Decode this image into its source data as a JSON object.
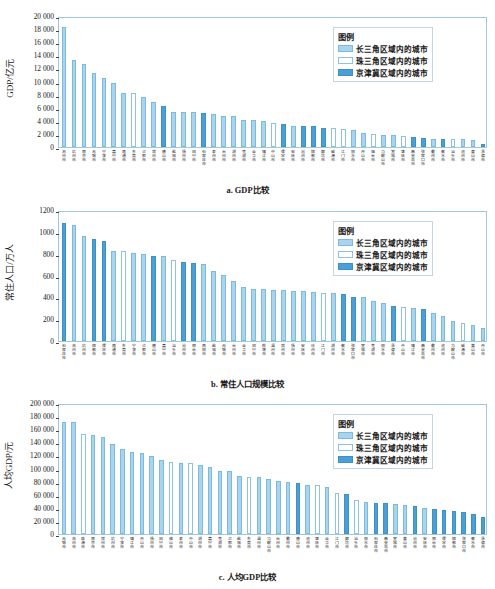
{
  "figure": {
    "legend_title": "图例",
    "legend_items": [
      {
        "key": "cj",
        "label": "长三角区域内的城市",
        "color": "#a9d4ec"
      },
      {
        "key": "zj",
        "label": "珠三角区域内的城市",
        "color": "#ffffff"
      },
      {
        "key": "jjj",
        "label": "京津冀区域内的城市",
        "color": "#48a0d6"
      }
    ]
  },
  "chart_data": [
    {
      "type": "bar",
      "id": "a",
      "title": "a. GDP比较",
      "xlabel": "",
      "ylabel": "GDP/亿元",
      "ylim": [
        0,
        20000
      ],
      "yticks": [
        0,
        2000,
        4000,
        6000,
        8000,
        10000,
        12000,
        14000,
        16000,
        18000,
        20000
      ],
      "ytick_labels": [
        "0",
        "2 000",
        "4 000",
        "6 000",
        "8 000",
        "10 000",
        "12 000",
        "14 000",
        "16 000",
        "18 000",
        "20 000"
      ],
      "grid": false,
      "legend_position": "top-right",
      "categories": [
        "苏州市",
        "杭州市",
        "南京市",
        "无锡市",
        "宁波市",
        "嘉兴市",
        "南通市",
        "东莞市",
        "合肥市",
        "常州市",
        "唐山市",
        "盐城市",
        "扬州市",
        "绍兴市",
        "石家庄市",
        "泰州市",
        "台州市",
        "湖州市",
        "芜湖市",
        "金华市",
        "镇江市",
        "中山市",
        "保定市",
        "安庆市",
        "沧州市",
        "邯郸市",
        "廊坊市",
        "威海市",
        "江门市",
        "丽水市",
        "舟山市",
        "烟台市",
        "马鞍山市",
        "宣城市",
        "肇庆市",
        "秦皇岛市",
        "张家口市",
        "衢州市",
        "衡水市",
        "汕头市",
        "池州市",
        "黄山市",
        "承德市"
      ],
      "values": [
        18600,
        13500,
        12800,
        11400,
        10700,
        9950,
        8450,
        8300,
        7800,
        7000,
        6350,
        5450,
        5400,
        5380,
        5320,
        5050,
        4850,
        4830,
        4150,
        4180,
        4080,
        3650,
        3530,
        3250,
        3230,
        3220,
        2980,
        2900,
        2820,
        2650,
        2120,
        1960,
        1830,
        1820,
        1780,
        1500,
        1330,
        1320,
        1310,
        1280,
        1250,
        1150,
        430
      ],
      "series_group": [
        "cj",
        "cj",
        "cj",
        "cj",
        "cj",
        "cj",
        "cj",
        "zj",
        "cj",
        "cj",
        "jjj",
        "cj",
        "cj",
        "cj",
        "jjj",
        "cj",
        "cj",
        "cj",
        "cj",
        "cj",
        "cj",
        "zj",
        "jjj",
        "cj",
        "jjj",
        "jjj",
        "jjj",
        "zj",
        "zj",
        "cj",
        "cj",
        "zj",
        "cj",
        "cj",
        "zj",
        "jjj",
        "jjj",
        "cj",
        "jjj",
        "zj",
        "cj",
        "cj",
        "jjj"
      ]
    },
    {
      "type": "bar",
      "id": "b",
      "title": "b. 常住人口规模比较",
      "xlabel": "",
      "ylabel": "常住人口/万人",
      "ylim": [
        0,
        1200
      ],
      "yticks": [
        0,
        200,
        400,
        600,
        800,
        1000,
        1200
      ],
      "ytick_labels": [
        "0",
        "200",
        "400",
        "600",
        "800",
        "1000",
        "1200"
      ],
      "grid": false,
      "legend_position": "top-right",
      "categories": [
        "石家庄市",
        "苏州市",
        "杭州市",
        "邯郸市",
        "保定市",
        "南通市",
        "东莞市",
        "宁波市",
        "合肥市",
        "唐山市",
        "嘉兴市",
        "汕头市",
        "沧州市",
        "邢台市",
        "南阳市",
        "盐城市",
        "无锡市",
        "台州市",
        "金华市",
        "绍兴市",
        "蚌埠市",
        "温州市",
        "常州市",
        "扬州市",
        "安庆市",
        "徐州市",
        "江门市",
        "湖州市",
        "衡水市",
        "张家口市",
        "宣城市",
        "芜湖市",
        "丽水市",
        "承德市",
        "中山市",
        "镇江市",
        "秦皇岛市",
        "衢州市",
        "池州市",
        "马鞍山市",
        "威海市",
        "黄山市",
        "舟山市"
      ],
      "values": [
        1095,
        1075,
        980,
        948,
        935,
        840,
        835,
        820,
        805,
        790,
        790,
        755,
        735,
        730,
        718,
        655,
        612,
        558,
        500,
        482,
        480,
        472,
        470,
        468,
        465,
        452,
        450,
        445,
        438,
        405,
        405,
        372,
        350,
        330,
        315,
        310,
        297,
        260,
        235,
        188,
        168,
        145,
        120
      ],
      "series_group": [
        "jjj",
        "cj",
        "cj",
        "jjj",
        "jjj",
        "cj",
        "zj",
        "cj",
        "cj",
        "jjj",
        "cj",
        "zj",
        "jjj",
        "jjj",
        "cj",
        "cj",
        "cj",
        "cj",
        "cj",
        "cj",
        "cj",
        "cj",
        "cj",
        "cj",
        "cj",
        "cj",
        "zj",
        "cj",
        "jjj",
        "jjj",
        "cj",
        "cj",
        "cj",
        "jjj",
        "zj",
        "cj",
        "jjj",
        "cj",
        "cj",
        "cj",
        "zj",
        "cj",
        "cj"
      ]
    },
    {
      "type": "bar",
      "id": "c",
      "title": "c. 人均GDP比较",
      "xlabel": "",
      "ylabel": "人均GDP/元",
      "ylim": [
        0,
        200000
      ],
      "yticks": [
        0,
        20000,
        40000,
        60000,
        80000,
        100000,
        120000,
        140000,
        160000,
        180000,
        200000
      ],
      "ytick_labels": [
        "0",
        "20 000",
        "40 000",
        "60 000",
        "80 000",
        "100 000",
        "120 000",
        "140 000",
        "160 000",
        "180 000",
        "200 000"
      ],
      "grid": false,
      "legend_position": "top-right",
      "categories": [
        "无锡市",
        "苏州市",
        "珠海市",
        "南京市",
        "常州市",
        "杭州市",
        "宁波市",
        "镇江市",
        "舟山市",
        "扬州市",
        "绍兴市",
        "佛山市",
        "泰州市",
        "中山市",
        "湖州市",
        "嘉兴市",
        "芜湖市",
        "合肥市",
        "盐城市",
        "东莞市",
        "温州市",
        "马鞍山市",
        "台州市",
        "衢州市",
        "唐山市",
        "池州市",
        "肇庆市",
        "金华市",
        "江门市",
        "廊坊市",
        "汕头市",
        "丽水市",
        "石家庄市",
        "秦皇岛市",
        "宣城市",
        "黄山市",
        "沧州市",
        "安庆市",
        "邢台市",
        "保定市",
        "邯郸市",
        "张家口市",
        "衡水市",
        "承德市"
      ],
      "values": [
        174000,
        173500,
        155000,
        153000,
        150000,
        140000,
        132500,
        127000,
        125500,
        121000,
        115000,
        112000,
        109500,
        109500,
        107500,
        103500,
        98000,
        97000,
        90000,
        88500,
        88000,
        85500,
        82500,
        80000,
        79000,
        76000,
        76000,
        73000,
        63500,
        62500,
        53000,
        50000,
        48500,
        48000,
        47000,
        44500,
        43000,
        41000,
        39000,
        38000,
        35000,
        33500,
        31000,
        27000
      ],
      "series_group": [
        "cj",
        "cj",
        "zj",
        "cj",
        "cj",
        "cj",
        "cj",
        "cj",
        "cj",
        "cj",
        "cj",
        "zj",
        "cj",
        "zj",
        "cj",
        "cj",
        "cj",
        "cj",
        "cj",
        "zj",
        "cj",
        "cj",
        "cj",
        "cj",
        "jjj",
        "cj",
        "zj",
        "cj",
        "zj",
        "jjj",
        "zj",
        "cj",
        "jjj",
        "jjj",
        "cj",
        "cj",
        "jjj",
        "cj",
        "jjj",
        "jjj",
        "jjj",
        "jjj",
        "jjj",
        "jjj"
      ]
    }
  ]
}
